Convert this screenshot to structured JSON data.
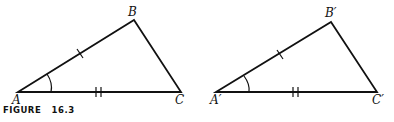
{
  "figure": {
    "caption": "FIGURE   16.3",
    "triangles": [
      {
        "name": "left",
        "labels": {
          "a": "A",
          "b": "B",
          "c": "C"
        }
      },
      {
        "name": "right",
        "labels": {
          "a": "A′",
          "b": "B′",
          "c": "C′"
        }
      }
    ],
    "markings": {
      "side_ab": "single tick",
      "side_ac": "double tick",
      "angle_a": "arc"
    }
  }
}
